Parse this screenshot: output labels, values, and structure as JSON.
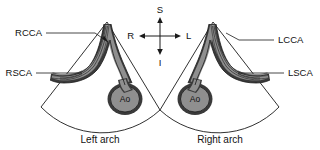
{
  "figure": {
    "type": "medical-ultrasound-schematic",
    "background_color": "#ffffff",
    "line_color": "#1a1a1a",
    "vessel_lumen_color": "#8f8f8f",
    "vessel_wall_color": "#3a3a3a"
  },
  "compass": {
    "name": "orientation-compass",
    "superior": "S",
    "inferior": "I",
    "right": "R",
    "left": "L"
  },
  "panels": [
    {
      "id": "left-arch",
      "caption": "Left arch",
      "aorta_label": "Ao",
      "mirrored": false,
      "labels": [
        {
          "id": "rcca",
          "text": "RCCA",
          "full_name": "right common carotid artery"
        },
        {
          "id": "rsca",
          "text": "RSCA",
          "full_name": "right subclavian artery"
        }
      ]
    },
    {
      "id": "right-arch",
      "caption": "Right arch",
      "aorta_label": "Ao",
      "mirrored": true,
      "labels": [
        {
          "id": "lcca",
          "text": "LCCA",
          "full_name": "left common carotid artery"
        },
        {
          "id": "lsca",
          "text": "LSCA",
          "full_name": "left subclavian artery"
        }
      ]
    }
  ]
}
